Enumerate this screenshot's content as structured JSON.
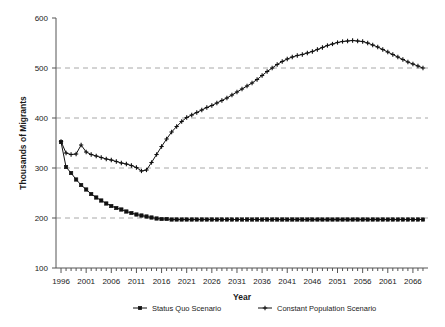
{
  "chart_data": {
    "type": "line",
    "title": "",
    "xlabel": "Year",
    "ylabel": "Thousands of Migrants",
    "xlim": [
      1995,
      2069
    ],
    "ylim": [
      100,
      600
    ],
    "yticks": [
      100,
      200,
      300,
      400,
      500,
      600
    ],
    "xticks": [
      1996,
      2001,
      2006,
      2011,
      2016,
      2021,
      2026,
      2031,
      2036,
      2041,
      2046,
      2051,
      2056,
      2061,
      2066
    ],
    "xtick_minor_step": 1,
    "grid": "horizontal-dashed",
    "legend_position": "bottom",
    "x": [
      1996,
      1997,
      1998,
      1999,
      2000,
      2001,
      2002,
      2003,
      2004,
      2005,
      2006,
      2007,
      2008,
      2009,
      2010,
      2011,
      2012,
      2013,
      2014,
      2015,
      2016,
      2017,
      2018,
      2019,
      2020,
      2021,
      2022,
      2023,
      2024,
      2025,
      2026,
      2027,
      2028,
      2029,
      2030,
      2031,
      2032,
      2033,
      2034,
      2035,
      2036,
      2037,
      2038,
      2039,
      2040,
      2041,
      2042,
      2043,
      2044,
      2045,
      2046,
      2047,
      2048,
      2049,
      2050,
      2051,
      2052,
      2053,
      2054,
      2055,
      2056,
      2057,
      2058,
      2059,
      2060,
      2061,
      2062,
      2063,
      2064,
      2065,
      2066,
      2067,
      2068
    ],
    "series": [
      {
        "name": "Status Quo Scenario",
        "marker": "square",
        "values": [
          352,
          302,
          290,
          277,
          266,
          257,
          248,
          241,
          235,
          229,
          224,
          220,
          217,
          213,
          210,
          207,
          205,
          203,
          201,
          199,
          198,
          198,
          197,
          197,
          197,
          197,
          197,
          197,
          197,
          197,
          197,
          197,
          197,
          197,
          197,
          197,
          197,
          197,
          197,
          197,
          197,
          197,
          197,
          197,
          197,
          197,
          197,
          197,
          197,
          197,
          197,
          197,
          197,
          197,
          197,
          197,
          197,
          197,
          197,
          197,
          197,
          197,
          197,
          197,
          197,
          197,
          197,
          197,
          197,
          197,
          197,
          197,
          197
        ]
      },
      {
        "name": "Constant Population Scenario",
        "marker": "cross",
        "values": [
          353,
          330,
          327,
          328,
          346,
          332,
          327,
          324,
          321,
          318,
          316,
          313,
          310,
          308,
          305,
          301,
          294,
          296,
          311,
          327,
          343,
          358,
          372,
          383,
          393,
          401,
          406,
          411,
          416,
          421,
          425,
          430,
          435,
          440,
          446,
          452,
          458,
          464,
          470,
          477,
          485,
          493,
          500,
          507,
          513,
          518,
          522,
          525,
          527,
          530,
          533,
          537,
          541,
          545,
          548,
          551,
          553,
          554,
          555,
          554,
          553,
          550,
          546,
          542,
          537,
          532,
          527,
          522,
          517,
          512,
          508,
          504,
          500
        ]
      }
    ]
  },
  "legend": {
    "items": [
      {
        "label": "Status Quo Scenario",
        "marker": "square"
      },
      {
        "label": "Constant Population Scenario",
        "marker": "cross"
      }
    ]
  },
  "colors": {
    "line": "#111111",
    "grid": "#a8a8a8",
    "axis": "#555555",
    "text": "#1a1a1a"
  }
}
